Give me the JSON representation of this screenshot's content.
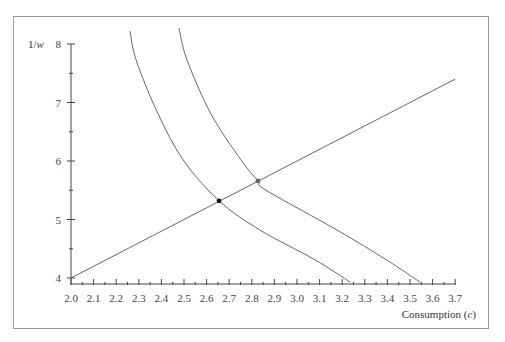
{
  "chart_data": {
    "type": "line",
    "title": "",
    "xlabel": "Consumption (c)",
    "ylabel": "1/w",
    "xlim": [
      2.0,
      3.7
    ],
    "ylim": [
      4,
      8
    ],
    "x_ticks": [
      "2.0",
      "2.1",
      "2.2",
      "2.3",
      "2.4",
      "2.5",
      "2.6",
      "2.7",
      "2.8",
      "2.9",
      "3.0",
      "3.1",
      "3.2",
      "3.3",
      "3.4",
      "3.5",
      "3.6",
      "3.7"
    ],
    "y_ticks": [
      "4",
      "5",
      "6",
      "7",
      "8"
    ],
    "grid": false,
    "legend": null,
    "series": [
      {
        "name": "straight line",
        "kind": "line",
        "points": [
          [
            2.0,
            4.0
          ],
          [
            3.7,
            7.4
          ]
        ]
      },
      {
        "name": "inner curve",
        "kind": "curve",
        "points": [
          [
            2.261,
            8.22
          ],
          [
            2.288,
            7.73
          ],
          [
            2.38,
            6.85
          ],
          [
            2.496,
            6.02
          ],
          [
            2.655,
            5.32
          ],
          [
            2.836,
            4.82
          ],
          [
            3.08,
            4.31
          ],
          [
            3.235,
            3.93
          ]
        ]
      },
      {
        "name": "outer curve",
        "kind": "curve",
        "points": [
          [
            2.478,
            8.27
          ],
          [
            2.513,
            7.73
          ],
          [
            2.62,
            6.8
          ],
          [
            2.752,
            6.02
          ],
          [
            2.827,
            5.66
          ],
          [
            2.863,
            5.5
          ],
          [
            3.177,
            4.82
          ],
          [
            3.4,
            4.3
          ],
          [
            3.544,
            3.93
          ]
        ]
      }
    ],
    "markers": [
      {
        "name": "intersection-1",
        "x": 2.655,
        "y": 5.32,
        "color": "#111111"
      },
      {
        "name": "intersection-2",
        "x": 2.827,
        "y": 5.66,
        "color": "#666666"
      }
    ]
  }
}
